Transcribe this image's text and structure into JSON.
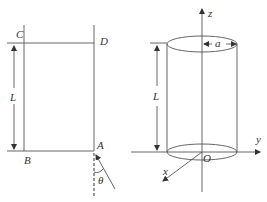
{
  "left_figure": {
    "labels": {
      "C": "C",
      "D": "D",
      "B": "B",
      "A": "A",
      "L": "L",
      "theta": "θ"
    }
  },
  "right_figure": {
    "labels": {
      "z": "z",
      "a": "a",
      "L": "L",
      "y": "y",
      "O": "O",
      "x": "x"
    }
  },
  "colors": {
    "line": "#555555",
    "text": "#333333",
    "background": "#ffffff"
  }
}
